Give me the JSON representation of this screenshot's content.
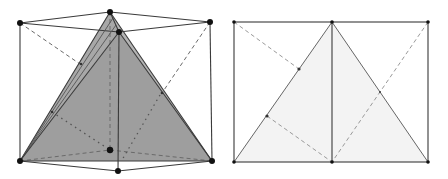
{
  "figure": {
    "colors": {
      "background": "#ffffff",
      "edge": "#3a3a3a",
      "shaded_face": "#9e9e9e",
      "shaded_face_light": "#b5b5b5",
      "net_fill": "#f3f3f3",
      "hidden_edge": "#6a6a6a",
      "vertex": "#111111"
    },
    "left_view": {
      "label": "3D prism with shaded tetrahedron",
      "vertices": {
        "top_left": [
          20,
          23
        ],
        "top_back": [
          110,
          12
        ],
        "top_front": [
          119,
          32
        ],
        "top_right": [
          210,
          22
        ],
        "bottom_left": [
          20,
          161
        ],
        "bottom_back": [
          110,
          150
        ],
        "bottom_front": [
          118,
          171
        ],
        "bottom_right": [
          212,
          161
        ]
      }
    },
    "right_view": {
      "label": "2D projection with triangle",
      "vertices": {
        "top_left": [
          234,
          22
        ],
        "top_middle": [
          332,
          22
        ],
        "top_right": [
          428,
          22
        ],
        "bottom_left": [
          234,
          162
        ],
        "bottom_middle": [
          332,
          162
        ],
        "bottom_right": [
          428,
          162
        ]
      },
      "marked_points": [
        [
          299,
          69
        ],
        [
          267,
          116
        ],
        [
          380,
          92
        ]
      ]
    }
  }
}
